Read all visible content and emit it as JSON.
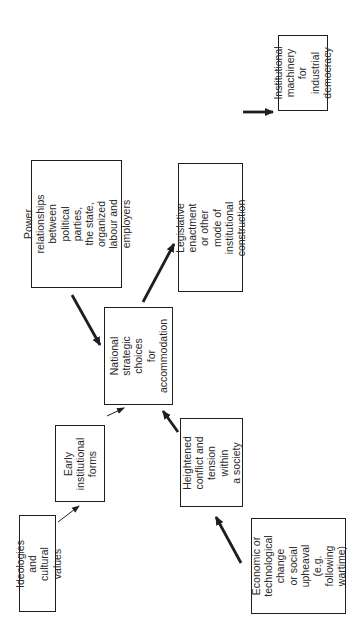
{
  "diagram": {
    "orientation": "rotated -90deg (text reads bottom-to-top)",
    "nodes": [
      {
        "id": "ideologies",
        "label": "Ideologies and\ncultural values"
      },
      {
        "id": "early-forms",
        "label": "Early\ninstitutional\nforms"
      },
      {
        "id": "power",
        "label": "Power relationships\nbetween\npolitical parties,\nthe state, organized\nlabour and employers"
      },
      {
        "id": "national",
        "label": "National\nstrategic\nchoices\nfor\naccommodation"
      },
      {
        "id": "heightened",
        "label": "Heightened\nconflict and\ntension within\na society"
      },
      {
        "id": "economic",
        "label": "Economic or\ntechnological\nchange\nor social\nupheaval\n(e.g. following\nwartime)"
      },
      {
        "id": "legislative",
        "label": "Legislative enactment\nor other mode of\ninstitutional\nconstruction"
      },
      {
        "id": "machinery",
        "label": "Institutional\nmachinery\nfor\nindustrial\ndemocracy"
      }
    ],
    "edges": [
      {
        "from": "ideologies",
        "to": "early-forms",
        "weight": "thin"
      },
      {
        "from": "early-forms",
        "to": "national",
        "weight": "thin"
      },
      {
        "from": "power",
        "to": "national",
        "weight": "thick"
      },
      {
        "from": "heightened",
        "to": "national",
        "weight": "thick"
      },
      {
        "from": "economic",
        "to": "heightened",
        "weight": "thick"
      },
      {
        "from": "national",
        "to": "legislative",
        "weight": "thick"
      },
      {
        "from": "legislative",
        "to": "machinery",
        "weight": "thick"
      }
    ]
  }
}
